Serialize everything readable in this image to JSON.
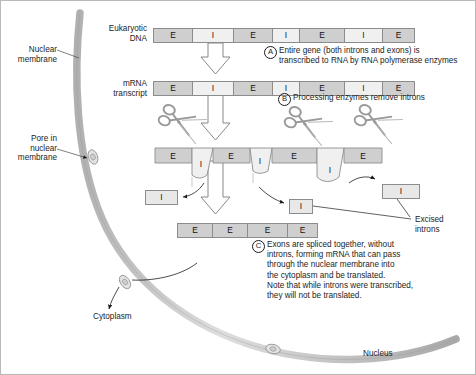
{
  "labels": {
    "nuclear_membrane": "Nuclear\nmembrane",
    "pore": "Pore in\nnuclear\nmembrane",
    "cytoplasm": "Cytoplasm",
    "nucleus": "Nucleus",
    "eukaryotic_dna": "Eukaryotic\nDNA",
    "mrna_transcript": "mRNA\ntranscript",
    "excised_introns": "Excised\nintrons"
  },
  "steps": [
    {
      "letter": "A",
      "text": "Entire gene (both introns and exons) is\ntranscribed to RNA by RNA polymerase enzymes"
    },
    {
      "letter": "B",
      "text": "Processing enzymes remove introns"
    },
    {
      "letter": "C",
      "text": "Exons are spliced together, without\nintrons, forming mRNA that can pass\nthrough the nuclear membrane into\nthe cytoplasm and be translated.\nNote that while introns were transcribed,\nthey will not be translated."
    }
  ],
  "sequences": {
    "dna": {
      "name": "Eukaryotic DNA",
      "segments": [
        {
          "type": "exon",
          "label": "E",
          "width": 40
        },
        {
          "type": "intron",
          "label": "I",
          "width": 42
        },
        {
          "type": "exon",
          "label": "E",
          "width": 40
        },
        {
          "type": "intron",
          "label": "I",
          "width": 28
        },
        {
          "type": "exon",
          "label": "E",
          "width": 46
        },
        {
          "type": "intron",
          "label": "I",
          "width": 39
        },
        {
          "type": "exon",
          "label": "E",
          "width": 33
        }
      ]
    },
    "transcript": {
      "name": "mRNA transcript",
      "segments": [
        {
          "type": "exon",
          "label": "E",
          "width": 40
        },
        {
          "type": "intron",
          "label": "I",
          "width": 42
        },
        {
          "type": "exon",
          "label": "E",
          "width": 40
        },
        {
          "type": "intron",
          "label": "I",
          "width": 28
        },
        {
          "type": "exon",
          "label": "E",
          "width": 46
        },
        {
          "type": "intron",
          "label": "I",
          "width": 39
        },
        {
          "type": "exon",
          "label": "E",
          "width": 33
        }
      ]
    },
    "looped": {
      "name": "transcript with looped-out introns",
      "exon_labels": [
        "E",
        "E",
        "E",
        "E"
      ],
      "intron_labels": [
        "I",
        "I",
        "I"
      ]
    },
    "spliced": {
      "name": "spliced mRNA",
      "segments": [
        {
          "type": "exon",
          "label": "E",
          "width": 36
        },
        {
          "type": "exon",
          "label": "E",
          "width": 36
        },
        {
          "type": "exon",
          "label": "E",
          "width": 41
        },
        {
          "type": "exon",
          "label": "E",
          "width": 31
        }
      ]
    },
    "excised": [
      {
        "label": "I",
        "x": 144,
        "y": 189,
        "width": 33
      },
      {
        "label": "I",
        "x": 288,
        "y": 198,
        "width": 24
      },
      {
        "label": "I",
        "x": 381,
        "y": 183,
        "width": 38
      }
    ]
  },
  "colors": {
    "exon_fill": "#cfcfcf",
    "intron_fill": "#f0f0f0",
    "membrane": "#c3c3c3",
    "outline": "#8c8c8c",
    "text": "#1c1c1c"
  },
  "icons": {
    "scissors_count": 3,
    "arrow_count": 4
  }
}
